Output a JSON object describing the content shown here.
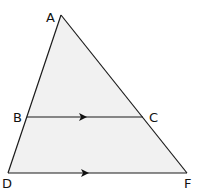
{
  "diagram": {
    "type": "geometry-triangle-parallel-lines",
    "fill_color": "#f1f1f1",
    "stroke_color": "#1a1a1a",
    "points": {
      "A": {
        "label": "A",
        "x": 61,
        "y": 15
      },
      "B": {
        "label": "B",
        "x": 27,
        "y": 117
      },
      "C": {
        "label": "C",
        "x": 143,
        "y": 117
      },
      "D": {
        "label": "D",
        "x": 8,
        "y": 173
      },
      "F": {
        "label": "F",
        "x": 187,
        "y": 173
      }
    },
    "segments": [
      "AD",
      "AF",
      "BC",
      "DF"
    ],
    "parallel_marks": [
      "BC",
      "DF"
    ]
  }
}
